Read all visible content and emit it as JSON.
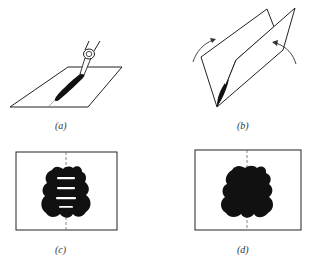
{
  "figure": {
    "panels": [
      {
        "id": "a",
        "label": "(a)",
        "description": "Pen drawing an ink line along the center crease of a flat sheet of paper"
      },
      {
        "id": "b",
        "label": "(b)",
        "description": "Sheet folded along the crease with arrows showing the two halves pressing together"
      },
      {
        "id": "c",
        "label": "(c)",
        "description": "Unfolded sheet showing a symmetric ink blot with white horizontal bars about the dashed fold line"
      },
      {
        "id": "d",
        "label": "(d)",
        "description": "Unfolded sheet showing a solid symmetric ink blot about the dashed fold line"
      }
    ]
  },
  "colors": {
    "ink": "#111111",
    "line": "#222222",
    "paper": "#ffffff",
    "fold_line": "#666666"
  }
}
